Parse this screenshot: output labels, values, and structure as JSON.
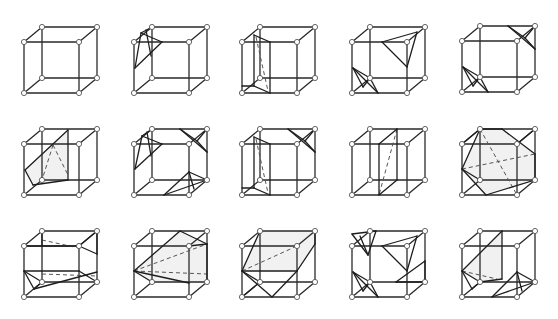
{
  "figure": {
    "rows": 3,
    "cols": 5,
    "cube_geometry": {
      "vertices": {
        "FTL": [
          0,
          0
        ],
        "FTR": [
          55,
          0
        ],
        "FBL": [
          0,
          51
        ],
        "FBR": [
          55,
          51
        ],
        "BTL": [
          18,
          -15
        ],
        "BTR": [
          73,
          -15
        ],
        "BBL": [
          18,
          36
        ],
        "BBR": [
          73,
          36
        ]
      },
      "edges": [
        [
          "FTL",
          "FTR"
        ],
        [
          "FTR",
          "FBR"
        ],
        [
          "FBR",
          "FBL"
        ],
        [
          "FBL",
          "FTL"
        ],
        [
          "BTL",
          "BTR"
        ],
        [
          "BTR",
          "BBR"
        ],
        [
          "BBR",
          "BBL"
        ],
        [
          "BBL",
          "BTL"
        ],
        [
          "FTL",
          "BTL"
        ],
        [
          "FTR",
          "BTR"
        ],
        [
          "FBR",
          "BBR"
        ],
        [
          "FBL",
          "BBL"
        ]
      ],
      "vertex_markers": [
        "FTL",
        "FTR",
        "FBL",
        "FBR",
        "BTL",
        "BTR",
        "BBL",
        "BBR"
      ]
    },
    "cubes": [
      {
        "id": "r1c1",
        "origin": [
          24,
          42
        ],
        "solid": [],
        "dashed": [],
        "shade": []
      },
      {
        "id": "r1c2",
        "origin": [
          134,
          42
        ],
        "solid": [
          [
            7,
            -9,
            28,
            0
          ],
          [
            28,
            0,
            1,
            26
          ],
          [
            7,
            -9,
            1,
            26
          ],
          [
            7,
            -9,
            18,
            -15
          ],
          [
            12,
            -12,
            17,
            14
          ]
        ],
        "dashed": [],
        "shade": []
      },
      {
        "id": "r1c3",
        "origin": [
          242,
          42
        ],
        "solid": [
          [
            12,
            -7,
            28,
            0
          ],
          [
            28,
            0,
            28,
            51
          ],
          [
            12,
            -7,
            12,
            44
          ],
          [
            12,
            44,
            28,
            51
          ],
          [
            0,
            44,
            12,
            44
          ]
        ],
        "dashed": [
          [
            14,
            -5,
            26,
            49
          ]
        ],
        "shade": []
      },
      {
        "id": "r1c4",
        "origin": [
          352,
          42
        ],
        "solid": [
          [
            30,
            0,
            65,
            -10
          ],
          [
            65,
            -10,
            55,
            25
          ],
          [
            55,
            25,
            30,
            0
          ],
          [
            1,
            26,
            26,
            51
          ],
          [
            1,
            26,
            18,
            36
          ],
          [
            18,
            36,
            26,
            51
          ],
          [
            1,
            26,
            11,
            45
          ],
          [
            11,
            45,
            18,
            36
          ]
        ],
        "dashed": [],
        "shade": []
      },
      {
        "id": "r1c5",
        "origin": [
          462,
          41
        ],
        "solid": [
          [
            46,
            -15,
            73,
            8
          ],
          [
            46,
            -15,
            63,
            -3
          ],
          [
            63,
            -3,
            73,
            8
          ],
          [
            63,
            -3,
            73,
            -15
          ],
          [
            1,
            26,
            26,
            51
          ],
          [
            1,
            26,
            18,
            36
          ],
          [
            18,
            36,
            26,
            51
          ],
          [
            1,
            26,
            11,
            45
          ],
          [
            11,
            45,
            18,
            36
          ]
        ],
        "dashed": [],
        "shade": []
      },
      {
        "id": "r2c1",
        "origin": [
          24,
          144
        ],
        "solid": [
          [
            44,
            -14,
            44,
            36
          ],
          [
            44,
            -14,
            1,
            26
          ],
          [
            1,
            26,
            9,
            41
          ],
          [
            9,
            41,
            44,
            36
          ]
        ],
        "dashed": [
          [
            29,
            1,
            18,
            36
          ],
          [
            29,
            1,
            44,
            31
          ]
        ],
        "shade": [
          [
            44,
            -14,
            1,
            26,
            9,
            41,
            44,
            36
          ]
        ]
      },
      {
        "id": "r2c2",
        "origin": [
          134,
          144
        ],
        "solid": [
          [
            8,
            -8,
            28,
            0
          ],
          [
            28,
            0,
            1,
            25
          ],
          [
            8,
            -8,
            1,
            25
          ],
          [
            8,
            -8,
            18,
            -15
          ],
          [
            13,
            -12,
            17,
            12
          ],
          [
            46,
            -15,
            73,
            8
          ],
          [
            46,
            -15,
            63,
            -3
          ],
          [
            63,
            -3,
            73,
            8
          ],
          [
            63,
            -3,
            73,
            -15
          ],
          [
            30,
            51,
            55,
            28
          ],
          [
            55,
            28,
            73,
            36
          ],
          [
            30,
            51,
            73,
            36
          ],
          [
            55,
            28,
            60,
            45
          ]
        ],
        "dashed": [],
        "shade": []
      },
      {
        "id": "r2c3",
        "origin": [
          242,
          144
        ],
        "solid": [
          [
            12,
            -7,
            28,
            0
          ],
          [
            28,
            0,
            28,
            51
          ],
          [
            12,
            -7,
            12,
            44
          ],
          [
            12,
            44,
            28,
            51
          ],
          [
            0,
            44,
            12,
            44
          ],
          [
            46,
            -15,
            73,
            8
          ],
          [
            46,
            -15,
            63,
            -3
          ],
          [
            63,
            -3,
            73,
            8
          ],
          [
            63,
            -3,
            73,
            -15
          ]
        ],
        "dashed": [
          [
            14,
            -5,
            26,
            49
          ]
        ],
        "shade": []
      },
      {
        "id": "r2c4",
        "origin": [
          352,
          144
        ],
        "solid": [
          [
            27,
            0,
            45,
            -15
          ],
          [
            27,
            0,
            27,
            51
          ],
          [
            45,
            -15,
            45,
            36
          ],
          [
            27,
            51,
            45,
            36
          ]
        ],
        "dashed": [
          [
            45,
            -15,
            27,
            51
          ]
        ],
        "shade": []
      },
      {
        "id": "r2c5",
        "origin": [
          462,
          144
        ],
        "solid": [
          [
            18,
            -15,
            0,
            25
          ],
          [
            0,
            25,
            24,
            51
          ],
          [
            24,
            51,
            73,
            36
          ],
          [
            73,
            36,
            73,
            10
          ],
          [
            73,
            10,
            40,
            -15
          ],
          [
            40,
            -15,
            18,
            -15
          ],
          [
            0,
            25,
            18,
            36
          ],
          [
            55,
            0,
            73,
            -15
          ],
          [
            0,
            0,
            18,
            -15
          ]
        ],
        "dashed": [
          [
            0,
            25,
            73,
            10
          ],
          [
            18,
            -15,
            55,
            51
          ]
        ],
        "shade": [
          [
            18,
            -15,
            40,
            -15,
            73,
            10,
            73,
            36,
            24,
            51,
            0,
            25
          ]
        ]
      },
      {
        "id": "r3c1",
        "origin": [
          24,
          246
        ],
        "solid": [
          [
            18,
            -15,
            18,
            0
          ],
          [
            0,
            0,
            18,
            0
          ],
          [
            18,
            0,
            55,
            0
          ],
          [
            55,
            0,
            73,
            -15
          ],
          [
            73,
            -15,
            73,
            8
          ],
          [
            55,
            0,
            73,
            8
          ],
          [
            0,
            25,
            18,
            36
          ],
          [
            0,
            25,
            55,
            25
          ],
          [
            55,
            25,
            73,
            36
          ],
          [
            0,
            25,
            10,
            43
          ],
          [
            10,
            43,
            18,
            36
          ],
          [
            10,
            43,
            73,
            26
          ]
        ],
        "dashed": [
          [
            18,
            -6,
            55,
            2
          ],
          [
            18,
            28,
            73,
            30
          ]
        ],
        "shade": []
      },
      {
        "id": "r3c2",
        "origin": [
          134,
          246
        ],
        "solid": [
          [
            46,
            -15,
            0,
            25
          ],
          [
            0,
            25,
            18,
            36
          ],
          [
            46,
            -15,
            73,
            -2
          ],
          [
            73,
            -2,
            73,
            36
          ],
          [
            73,
            -2,
            55,
            0
          ],
          [
            0,
            25,
            55,
            37
          ]
        ],
        "dashed": [
          [
            0,
            25,
            73,
            -2
          ],
          [
            0,
            25,
            73,
            28
          ]
        ],
        "shade": [
          [
            46,
            -15,
            73,
            -2,
            73,
            36,
            18,
            36,
            0,
            25
          ]
        ]
      },
      {
        "id": "r3c3",
        "origin": [
          242,
          246
        ],
        "solid": [
          [
            18,
            -15,
            0,
            25
          ],
          [
            0,
            25,
            55,
            25
          ],
          [
            55,
            25,
            73,
            -2
          ],
          [
            73,
            -2,
            73,
            -15
          ],
          [
            0,
            25,
            30,
            51
          ],
          [
            30,
            51,
            55,
            25
          ],
          [
            0,
            51,
            18,
            36
          ],
          [
            18,
            36,
            0,
            25
          ]
        ],
        "dashed": [
          [
            0,
            25,
            55,
            0
          ],
          [
            18,
            36,
            45,
            36
          ]
        ],
        "shade": [
          [
            18,
            -15,
            73,
            -15,
            73,
            -2,
            55,
            25,
            0,
            25
          ]
        ]
      },
      {
        "id": "r3c4",
        "origin": [
          352,
          246
        ],
        "solid": [
          [
            0,
            -12,
            24,
            -15
          ],
          [
            24,
            -15,
            16,
            9
          ],
          [
            16,
            9,
            0,
            -12
          ],
          [
            8,
            -10,
            16,
            9
          ],
          [
            30,
            0,
            65,
            -10
          ],
          [
            65,
            -10,
            55,
            25
          ],
          [
            55,
            25,
            30,
            0
          ],
          [
            44,
            36,
            73,
            15
          ],
          [
            73,
            15,
            73,
            36
          ],
          [
            44,
            36,
            73,
            36
          ],
          [
            1,
            26,
            26,
            51
          ],
          [
            1,
            26,
            18,
            36
          ],
          [
            18,
            36,
            26,
            51
          ],
          [
            1,
            26,
            11,
            45
          ],
          [
            11,
            45,
            18,
            36
          ]
        ],
        "dashed": [],
        "shade": []
      },
      {
        "id": "r3c5",
        "origin": [
          462,
          246
        ],
        "solid": [
          [
            40,
            -15,
            0,
            25
          ],
          [
            0,
            25,
            18,
            36
          ],
          [
            18,
            36,
            40,
            33
          ],
          [
            40,
            -15,
            40,
            33
          ],
          [
            0,
            25,
            10,
            43
          ],
          [
            10,
            43,
            18,
            36
          ],
          [
            30,
            51,
            55,
            26
          ],
          [
            55,
            26,
            73,
            36
          ],
          [
            30,
            51,
            73,
            36
          ],
          [
            55,
            26,
            60,
            45
          ]
        ],
        "dashed": [
          [
            0,
            25,
            35,
            33
          ]
        ],
        "shade": [
          [
            40,
            -15,
            40,
            33,
            18,
            36,
            0,
            25
          ]
        ]
      }
    ]
  }
}
